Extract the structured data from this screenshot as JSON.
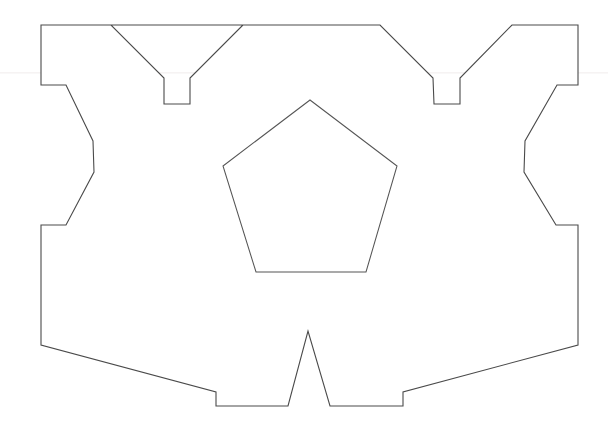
{
  "page": {
    "background_color": "#ffffff",
    "width": 608,
    "height": 429
  },
  "figure": {
    "name": "symmetric-polygon-with-pentagon",
    "stroke_color": "#4a4a4a",
    "fill_color": "#ffffff",
    "stroke_width": 1.1,
    "outer_polygon": {
      "name": "outer-outline",
      "point_count": 34,
      "points": "41,25 243,25 190,78 190,104 164,104 164,78 111,25 ",
      "path": "M 41,25 L 243,25 L 190,78 L 190,104 L 164,104 L 164,78 L 111,25 Z"
    },
    "inner_pentagon": {
      "name": "inner-pentagon",
      "sides": 5,
      "apex": "310,100",
      "left_upper": "223,166",
      "right_upper": "397,166",
      "left_lower": "256,272",
      "right_lower": "366,272",
      "path": "M 310,100 L 397,166 L 366,272 L 256,272 L 223,166 Z"
    }
  },
  "outline_path_d": "M 41,25 L 243,25 L 190,78 L 190,104 L 164,104 L 164,78 L 111,25 L 41,25 L 41,85 L 66,85 L 93,141 L 94,172 L 66,225 L 41,225 L 41,345 L 216,392 L 216,406 L 288,406 L 308,331 L 330,406 L 403,406 L 403,392 L 578,345 L 578,225 L 556,225 L 524,172 L 525,141 L 557,85 L 578,85 L 578,25 L 512,25 L 460,78 L 460,104 L 434,104 L 433,78 L 380,25 L 243,25",
  "pentagon_path_d": "M 310,100 L 397,166 L 366,272 L 256,272 L 223,166 Z",
  "artifacts": {
    "scanline_1_y": 72,
    "scanline_2_y": 73,
    "color": "#f4f1f1"
  }
}
